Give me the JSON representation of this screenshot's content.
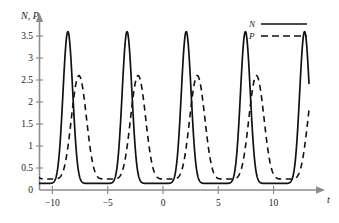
{
  "chart_data": {
    "type": "line",
    "title": "",
    "subtitle": "",
    "xlabel": "t",
    "ylabel": "N, P",
    "xlim": [
      -12.2,
      13.2
    ],
    "ylim": [
      0,
      3.9
    ],
    "xticks": [
      -10,
      -5,
      0,
      5,
      10
    ],
    "xtick_labels": [
      "−10",
      "−5",
      "0",
      "5",
      "10"
    ],
    "yticks": [
      0,
      0.5,
      1,
      1.5,
      2,
      2.5,
      3,
      3.5
    ],
    "ytick_labels": [
      "0",
      "0.5",
      "1",
      "1.5",
      "2",
      "2.5",
      "3",
      "3.5"
    ],
    "grid": false,
    "legend_position": "top-right",
    "series": [
      {
        "name": "N",
        "style": "solid",
        "color": "#111111",
        "peak_value": 3.6,
        "trough_value": 0.15,
        "period": 5.35,
        "peak_times": [
          -8.6,
          -3.25,
          2.15,
          7.45,
          12.8
        ],
        "points": [
          [
            -12.2,
            0.14
          ],
          [
            -11.8,
            0.15
          ],
          [
            -11.4,
            0.17
          ],
          [
            -11.0,
            0.2
          ],
          [
            -10.6,
            0.25
          ],
          [
            -10.2,
            0.32
          ],
          [
            -9.9,
            0.42
          ],
          [
            -9.6,
            0.58
          ],
          [
            -9.35,
            0.8
          ],
          [
            -9.15,
            1.05
          ],
          [
            -9.0,
            1.35
          ],
          [
            -8.85,
            1.8
          ],
          [
            -8.75,
            2.3
          ],
          [
            -8.68,
            2.85
          ],
          [
            -8.62,
            3.3
          ],
          [
            -8.58,
            3.55
          ],
          [
            -8.52,
            3.6
          ],
          [
            -8.45,
            3.52
          ],
          [
            -8.38,
            3.3
          ],
          [
            -8.3,
            2.95
          ],
          [
            -8.2,
            2.5
          ],
          [
            -8.08,
            2.05
          ],
          [
            -7.95,
            1.65
          ],
          [
            -7.8,
            1.3
          ],
          [
            -7.6,
            0.98
          ],
          [
            -7.35,
            0.72
          ],
          [
            -7.05,
            0.52
          ],
          [
            -6.7,
            0.37
          ],
          [
            -6.3,
            0.27
          ],
          [
            -5.9,
            0.21
          ],
          [
            -5.5,
            0.17
          ],
          [
            -5.1,
            0.15
          ],
          [
            -4.7,
            0.15
          ],
          [
            -4.3,
            0.17
          ],
          [
            -3.95,
            0.21
          ],
          [
            -3.6,
            0.3
          ],
          [
            -3.4,
            0.4
          ],
          [
            -3.25,
            0.55
          ],
          [
            -9.0,
            1.35
          ]
        ]
      },
      {
        "name": "P",
        "style": "dashed",
        "color": "#111111",
        "peak_value": 2.6,
        "trough_value": 0.25,
        "period": 5.35,
        "phase_lag": 1.0,
        "peak_times": [
          -7.6,
          -2.25,
          3.15,
          8.45
        ],
        "left_edge_value": 0.7
      }
    ],
    "legend": [
      {
        "label": "N",
        "style": "solid"
      },
      {
        "label": "P",
        "style": "dashed"
      }
    ],
    "axis_color": "#8c8c8c",
    "curve_color": "#111111",
    "background": "#ffffff"
  },
  "figure": {
    "axis_label_y": "N, P",
    "axis_label_x": "t"
  }
}
